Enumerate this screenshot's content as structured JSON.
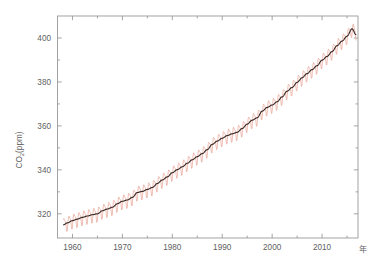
{
  "chart_data": {
    "type": "line",
    "title": "",
    "subtitle": "",
    "xlabel": "年",
    "ylabel": "CO₂(ppm)",
    "ylabel_main": "CO",
    "ylabel_sub": "2",
    "ylabel_rest": "(ppm)",
    "xlim": [
      1957.0,
      2017.2
    ],
    "ylim": [
      309.0,
      410.0
    ],
    "grid": false,
    "legend": false,
    "legend_position": "none",
    "x_ticks_major": [
      1960,
      1970,
      1980,
      1990,
      2000,
      2010
    ],
    "x_tick_labels": [
      "1960",
      "1970",
      "1980",
      "1990",
      "2000",
      "2010"
    ],
    "x_ticks_minor": [
      1965,
      1975,
      1985,
      1995,
      2005,
      2015
    ],
    "y_ticks_major": [
      320,
      340,
      360,
      380,
      400
    ],
    "y_tick_labels": [
      "320",
      "340",
      "360",
      "380",
      "400"
    ],
    "y_ticks_minor": [
      330,
      350,
      370,
      390
    ],
    "colors": {
      "monthly": "#e8a79a",
      "trend": "#3a2a26",
      "axis": "#9a9a9a",
      "text": "#5f5f5f",
      "background": "#ffffff"
    },
    "series": [
      {
        "name": "monthly mean CO2",
        "style": "oscillating",
        "color": "#e8a79a",
        "seasonal_amplitude_ppm": 3.1,
        "description": "Monthly mean atmospheric CO2 with seasonal cycle"
      },
      {
        "name": "trend (seasonally adjusted)",
        "style": "smooth",
        "color": "#3a2a26",
        "description": "Seasonally adjusted trend line"
      }
    ],
    "x": [
      1958.2,
      1959,
      1960,
      1961,
      1962,
      1963,
      1964,
      1965,
      1966,
      1967,
      1968,
      1969,
      1970,
      1971,
      1972,
      1973,
      1974,
      1975,
      1976,
      1977,
      1978,
      1979,
      1980,
      1981,
      1982,
      1983,
      1984,
      1985,
      1986,
      1987,
      1988,
      1989,
      1990,
      1991,
      1992,
      1993,
      1994,
      1995,
      1996,
      1997,
      1998,
      1999,
      2000,
      2001,
      2002,
      2003,
      2004,
      2005,
      2006,
      2007,
      2008,
      2009,
      2010,
      2011,
      2012,
      2013,
      2014,
      2015,
      2016,
      2016.8
    ],
    "values": [
      315.0,
      315.9,
      316.9,
      317.6,
      318.4,
      319.0,
      319.6,
      320.0,
      321.4,
      322.2,
      323.0,
      324.6,
      325.7,
      326.3,
      327.5,
      329.7,
      330.2,
      331.1,
      332.0,
      333.8,
      335.4,
      336.8,
      338.7,
      340.1,
      341.4,
      343.0,
      344.6,
      346.0,
      347.4,
      349.2,
      351.6,
      353.1,
      354.4,
      355.6,
      356.4,
      357.1,
      358.8,
      360.8,
      362.6,
      363.7,
      366.7,
      368.4,
      369.5,
      371.0,
      373.2,
      375.8,
      377.5,
      379.8,
      381.9,
      383.8,
      385.6,
      387.4,
      389.9,
      391.6,
      393.8,
      396.5,
      398.6,
      400.8,
      404.2,
      401.5
    ]
  }
}
